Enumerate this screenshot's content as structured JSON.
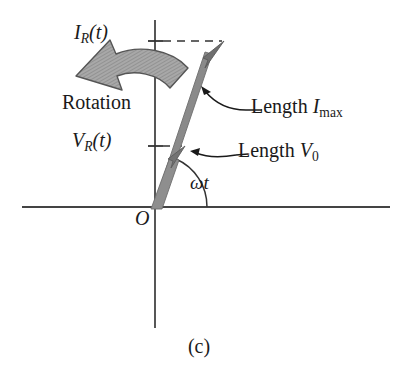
{
  "figure": {
    "caption": "(c)",
    "type": "phasor-diagram"
  },
  "axes": {
    "x_axis_name": "horizontal-axis",
    "y_axis_name": "vertical-axis",
    "origin_label": "O"
  },
  "labels": {
    "current_projection": {
      "symbol": "I",
      "subscript": "R",
      "arg": "(t)",
      "full": "I_R(t)"
    },
    "voltage_projection": {
      "symbol": "V",
      "subscript": "R",
      "arg": "(t)",
      "full": "V_R(t)"
    },
    "rotation": "Rotation",
    "angle": "ωt",
    "length_current": {
      "prefix": "Length ",
      "symbol": "I",
      "subscript": "max",
      "full": "Length I_max"
    },
    "length_voltage": {
      "prefix": "Length ",
      "symbol": "V",
      "subscript": "0",
      "full": "Length V_0"
    }
  },
  "geometry": {
    "origin": {
      "x": 155,
      "y": 207
    },
    "angle_wt_degrees": 66,
    "current_phasor_tip": {
      "x": 224,
      "y": 41
    },
    "voltage_phasor_tip": {
      "x": 185,
      "y": 146
    },
    "x_axis_span": [
      22,
      390
    ],
    "y_axis_span": [
      20,
      328
    ],
    "dashed_line_current_y": 41,
    "dashed_line_voltage_y": 146,
    "arc_radius": 52
  },
  "colors": {
    "ink": "#1a1a1a",
    "axis": "#444444",
    "phasor_fill": "#8a8a8a",
    "phasor_stroke": "#5a5a5a",
    "rotation_arrow_fill": "#a8a8a8",
    "rotation_arrow_stroke": "#555555",
    "dashed": "#333333",
    "background": "#ffffff"
  }
}
